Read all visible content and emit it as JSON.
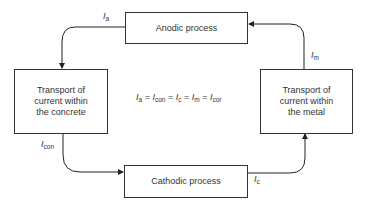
{
  "diagram": {
    "boxes": {
      "anodic": "Anodic process",
      "cathodic": "Cathodic process",
      "concrete": [
        "Transport of",
        "current within",
        "the concrete"
      ],
      "metal": [
        "Transport of",
        "current within",
        "the metal"
      ]
    },
    "labels": {
      "Ia": {
        "main": "I",
        "sub": "a"
      },
      "Icon": {
        "main": "I",
        "sub": "con"
      },
      "Ic": {
        "main": "I",
        "sub": "c"
      },
      "Im": {
        "main": "I",
        "sub": "m"
      }
    },
    "equation": {
      "terms": [
        {
          "main": "I",
          "sub": "a"
        },
        {
          "main": "I",
          "sub": "con"
        },
        {
          "main": "I",
          "sub": "c"
        },
        {
          "main": "I",
          "sub": "m"
        },
        {
          "main": "I",
          "sub": "cor"
        }
      ],
      "separator": " = "
    }
  }
}
